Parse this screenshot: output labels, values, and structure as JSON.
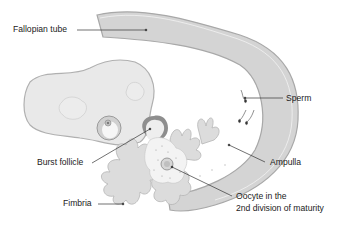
{
  "diagram": {
    "labels": {
      "fallopian_tube": "Fallopian tube",
      "sperm": "Sperm",
      "burst_follicle": "Burst follicle",
      "ampulla": "Ampulla",
      "fimbria": "Fimbria",
      "oocyte_line1": "Oocyte in the",
      "oocyte_line2": "2nd division of maturity"
    },
    "colors": {
      "tube_fill": "#d4d4d4",
      "tube_edge": "#a8a8a8",
      "ovary_fill": "#e9e9e9",
      "ovary_edge": "#b0b0b0",
      "fimbria_fill": "#dcdcdc",
      "leader_line": "#333333",
      "text": "#222222"
    }
  }
}
